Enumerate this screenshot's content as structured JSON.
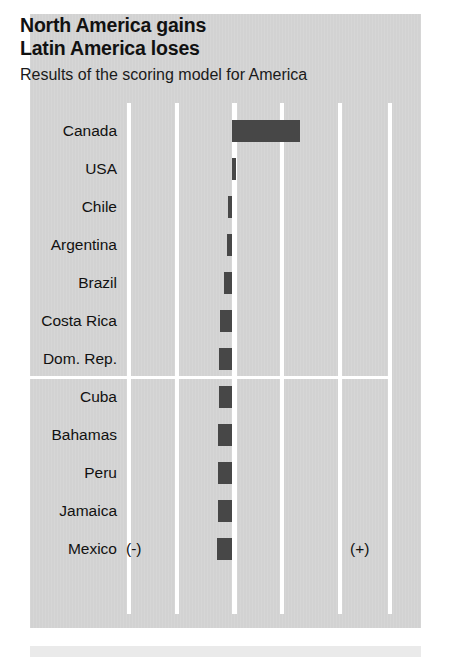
{
  "header": {
    "title_line1": "North America gains",
    "title_line2": "Latin America loses",
    "subtitle": "Results of the scoring model for America"
  },
  "axis_markers": {
    "negative": "(-)",
    "positive": "(+)"
  },
  "colors": {
    "panel_background": "#d2d2d2",
    "bar": "#474747",
    "gridline": "#ffffff",
    "text": "#111111",
    "page_background": "#ffffff",
    "footer_band": "#eaeaea"
  },
  "chart_data": {
    "type": "bar",
    "orientation": "horizontal",
    "subtitle": "Results of the scoring model for America",
    "xlabel": "",
    "ylabel": "",
    "grid": true,
    "legend": false,
    "diverging": true,
    "zero_gridline": 0,
    "xlim": [
      -2.2,
      3.3
    ],
    "xticks": [
      -2.2,
      -1.2,
      0,
      1.0,
      2.2,
      3.25
    ],
    "categories": [
      "Canada",
      "USA",
      "Chile",
      "Argentina",
      "Brazil",
      "Costa Rica",
      "Dom. Rep.",
      "Cuba",
      "Bahamas",
      "Peru",
      "Jamaica",
      "Mexico"
    ],
    "values": [
      2.85,
      0.16,
      -0.16,
      -0.19,
      -0.34,
      -0.52,
      -0.55,
      -0.55,
      -0.57,
      -0.57,
      -0.59,
      -0.64
    ],
    "annotations": [
      {
        "text": "(-)",
        "position": "bottom-left"
      },
      {
        "text": "(+)",
        "position": "bottom-right"
      }
    ],
    "group_separator_after": "Dom. Rep."
  }
}
